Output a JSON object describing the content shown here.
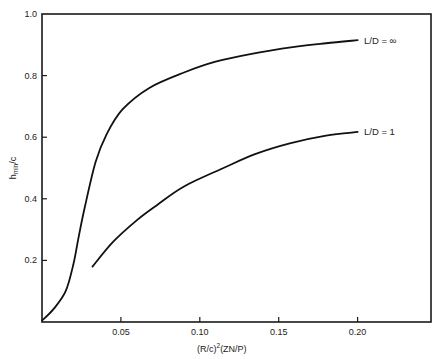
{
  "chart_data": {
    "type": "line",
    "title": "",
    "xlabel": "(R/c)²(ZN/P)",
    "ylabel": "h_min/c",
    "xlim": [
      0,
      0.2465
    ],
    "ylim": [
      0,
      1.0
    ],
    "x_ticks": [
      "0.05",
      "0.10",
      "0.15",
      "0.20"
    ],
    "x_tick_values": [
      0.05,
      0.1,
      0.15,
      0.2
    ],
    "y_ticks": [
      "0.2",
      "0.4",
      "0.6",
      "0.8",
      "1.0"
    ],
    "y_tick_values": [
      0.2,
      0.4,
      0.6,
      0.8,
      1.0
    ],
    "grid": false,
    "legend": "inline labels at right end of curves",
    "series": [
      {
        "name": "L/D = ∞",
        "label": "L/D = ∞",
        "x": [
          0.0,
          0.007,
          0.015,
          0.02,
          0.023,
          0.027,
          0.034,
          0.041,
          0.051,
          0.068,
          0.09,
          0.11,
          0.132,
          0.16,
          0.18,
          0.2
        ],
        "y": [
          0.005,
          0.04,
          0.1,
          0.19,
          0.27,
          0.37,
          0.52,
          0.61,
          0.69,
          0.76,
          0.81,
          0.845,
          0.87,
          0.893,
          0.905,
          0.915
        ]
      },
      {
        "name": "L/D = 1",
        "label": "L/D = 1",
        "x": [
          0.032,
          0.045,
          0.06,
          0.073,
          0.09,
          0.115,
          0.135,
          0.157,
          0.18,
          0.2
        ],
        "y": [
          0.18,
          0.26,
          0.33,
          0.38,
          0.44,
          0.5,
          0.545,
          0.58,
          0.605,
          0.617
        ]
      }
    ]
  },
  "labels": {
    "x_axis_title_base": "(R/c)",
    "x_axis_title_sup": "2",
    "x_axis_title_rest": "(ZN/P)",
    "y_axis_title_base": "h",
    "y_axis_title_sub": "min",
    "y_axis_title_rest": "/c",
    "series_inf": "L/D = ∞",
    "series_one": "L/D = 1"
  }
}
